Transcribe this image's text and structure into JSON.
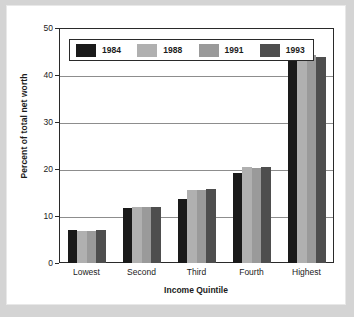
{
  "chart_data": {
    "type": "bar",
    "title": "",
    "xlabel": "Income Quintile",
    "ylabel": "Percent of total net worth",
    "categories": [
      "Lowest",
      "Second",
      "Third",
      "Fourth",
      "Highest"
    ],
    "ylim": [
      0,
      50
    ],
    "yticks": [
      0,
      10,
      20,
      30,
      40,
      50
    ],
    "ytick_labels": [
      "0",
      "10",
      "20",
      "30",
      "40",
      "50"
    ],
    "grid": true,
    "legend_position": "upper left",
    "series": [
      {
        "name": "1984",
        "color": "#1a1a1a",
        "values": [
          7.1,
          11.6,
          13.7,
          19.1,
          47.5
        ]
      },
      {
        "name": "1988",
        "color": "#b0b0b0",
        "values": [
          6.9,
          12.0,
          15.5,
          20.4,
          44.2
        ]
      },
      {
        "name": "1991",
        "color": "#9a9a9a",
        "values": [
          6.8,
          11.9,
          15.5,
          20.3,
          44.3
        ]
      },
      {
        "name": "1993",
        "color": "#4e4e4e",
        "values": [
          7.1,
          12.0,
          15.8,
          20.4,
          43.8
        ]
      }
    ]
  },
  "figure": {
    "background_color": "#d4d4d4",
    "card_color": "#ffffff",
    "axis_color": "#2a2a2a",
    "gridline_color": "#8d8d8d"
  }
}
